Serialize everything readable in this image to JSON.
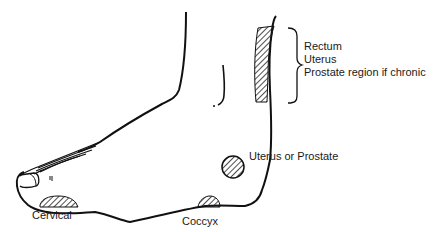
{
  "diagram": {
    "type": "anatomical reflexology foot diagram",
    "labels": {
      "bracket_items": [
        "Rectum",
        "Uterus",
        "Prostate region if chronic"
      ],
      "uterus_prostate": "Uterus or Prostate",
      "cervical": "Cervical",
      "coccyx": "Coccyx"
    },
    "colors": {
      "line": "#111111",
      "hatch": "#222222",
      "background": "#ffffff"
    }
  }
}
